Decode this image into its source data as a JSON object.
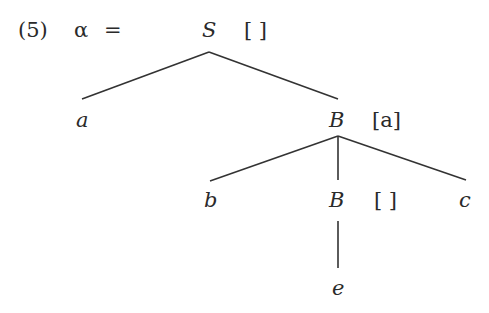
{
  "example": {
    "number": "(5)",
    "lhs": "α",
    "equals": "="
  },
  "tree": {
    "root": {
      "label": "S",
      "stack": "[ ]"
    },
    "level1": [
      {
        "label": "a"
      },
      {
        "label": "B",
        "stack": "[a]"
      }
    ],
    "level2": [
      {
        "label": "b"
      },
      {
        "label": "B",
        "stack": "[ ]"
      },
      {
        "label": "c"
      }
    ],
    "level3": [
      {
        "label": "e"
      }
    ],
    "edges": [
      [
        "S",
        "a"
      ],
      [
        "S",
        "B[a]"
      ],
      [
        "B[a]",
        "b"
      ],
      [
        "B[a]",
        "B[ ]"
      ],
      [
        "B[a]",
        "c"
      ],
      [
        "B[ ]",
        "e"
      ]
    ]
  }
}
